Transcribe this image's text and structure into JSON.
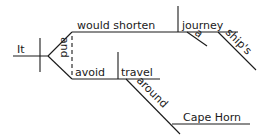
{
  "diagram": {
    "type": "sentence-diagram",
    "words": {
      "subject": "It",
      "conjunction": "and",
      "verb1": "would shorten",
      "object1": "journey",
      "modifier1": "a",
      "modifier2": "ship's",
      "verb2": "avoid",
      "object2": "travel",
      "preposition": "around",
      "prep_object": "Cape Horn"
    },
    "colors": {
      "ink": "#1a1a1a",
      "background": "#ffffff"
    }
  }
}
